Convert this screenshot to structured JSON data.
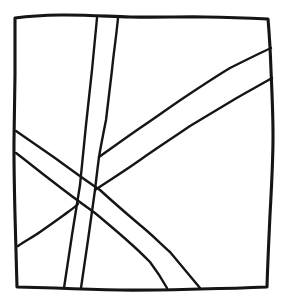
{
  "figure": {
    "type": "line-drawing",
    "canvas_width": 282,
    "canvas_height": 303,
    "background_color": "#ffffff",
    "ink_color": "#151515",
    "style": "hand-drawn ink sketch, slightly wobbly single-weight outlines, no fill, no text labels",
    "element_count": 6
  },
  "chart_data": {
    "type": "line",
    "xlabel": "",
    "ylabel": "",
    "xlim": [
      0,
      282
    ],
    "ylim": [
      0,
      303
    ],
    "grid": false,
    "legend": "none",
    "annotations": [],
    "series": [
      {
        "name": "outer-frame",
        "role": "border square",
        "closed": true,
        "points": [
          [
            15,
            18
          ],
          [
            60,
            15
          ],
          [
            130,
            17
          ],
          [
            205,
            17
          ],
          [
            268,
            19
          ],
          [
            271,
            70
          ],
          [
            273,
            140
          ],
          [
            270,
            215
          ],
          [
            267,
            287
          ],
          [
            200,
            289
          ],
          [
            120,
            290
          ],
          [
            55,
            288
          ],
          [
            17,
            287
          ],
          [
            15,
            215
          ],
          [
            14,
            140
          ],
          [
            15,
            75
          ],
          [
            15,
            18
          ]
        ]
      },
      {
        "name": "vertical-band-left-edge",
        "role": "near-vertical band, left outline",
        "closed": false,
        "points": [
          [
            97,
            18
          ],
          [
            92,
            70
          ],
          [
            86,
            125
          ],
          [
            80,
            185
          ],
          [
            72,
            235
          ],
          [
            64,
            288
          ]
        ]
      },
      {
        "name": "vertical-band-right-edge",
        "role": "near-vertical band, right outline",
        "closed": false,
        "points": [
          [
            118,
            18
          ],
          [
            112,
            70
          ],
          [
            106,
            120
          ],
          [
            99,
            157
          ],
          [
            95,
            190
          ],
          [
            88,
            240
          ],
          [
            81,
            288
          ]
        ]
      },
      {
        "name": "upper-right-band-top-edge",
        "role": "diagonal band from centre to right edge, upper outline",
        "closed": false,
        "points": [
          [
            99,
            157
          ],
          [
            140,
            128
          ],
          [
            185,
            97
          ],
          [
            230,
            68
          ],
          [
            271,
            48
          ]
        ]
      },
      {
        "name": "upper-right-band-bottom-edge",
        "role": "diagonal band from centre to right edge, lower outline",
        "closed": false,
        "points": [
          [
            95,
            190
          ],
          [
            140,
            160
          ],
          [
            190,
            126
          ],
          [
            235,
            99
          ],
          [
            272,
            78
          ]
        ]
      },
      {
        "name": "descending-band-upper-edge",
        "role": "long diagonal band from upper-left edge to bottom edge, upper outline",
        "closed": false,
        "points": [
          [
            16,
            131
          ],
          [
            55,
            158
          ],
          [
            100,
            190
          ],
          [
            140,
            225
          ],
          [
            170,
            252
          ],
          [
            200,
            288
          ]
        ]
      },
      {
        "name": "descending-band-lower-edge",
        "role": "long diagonal band from left edge to bottom edge, lower outline",
        "closed": false,
        "points": [
          [
            16,
            153
          ],
          [
            52,
            181
          ],
          [
            95,
            213
          ],
          [
            130,
            243
          ],
          [
            150,
            262
          ],
          [
            167,
            288
          ]
        ]
      },
      {
        "name": "lower-left-band-edge",
        "role": "short diagonal outline in lower-left region",
        "closed": false,
        "points": [
          [
            18,
            246
          ],
          [
            40,
            232
          ],
          [
            68,
            212
          ],
          [
            78,
            204
          ]
        ]
      }
    ]
  },
  "accessibility": {
    "alt_text": "A hand-drawn square frame containing a narrow near-vertical band running from the top edge down to the bottom edge, two diagonal bands fanning from the centre toward the right edge, and a wide diagonal band descending from the left edge to the bottom edge, crossing the vertical band."
  }
}
